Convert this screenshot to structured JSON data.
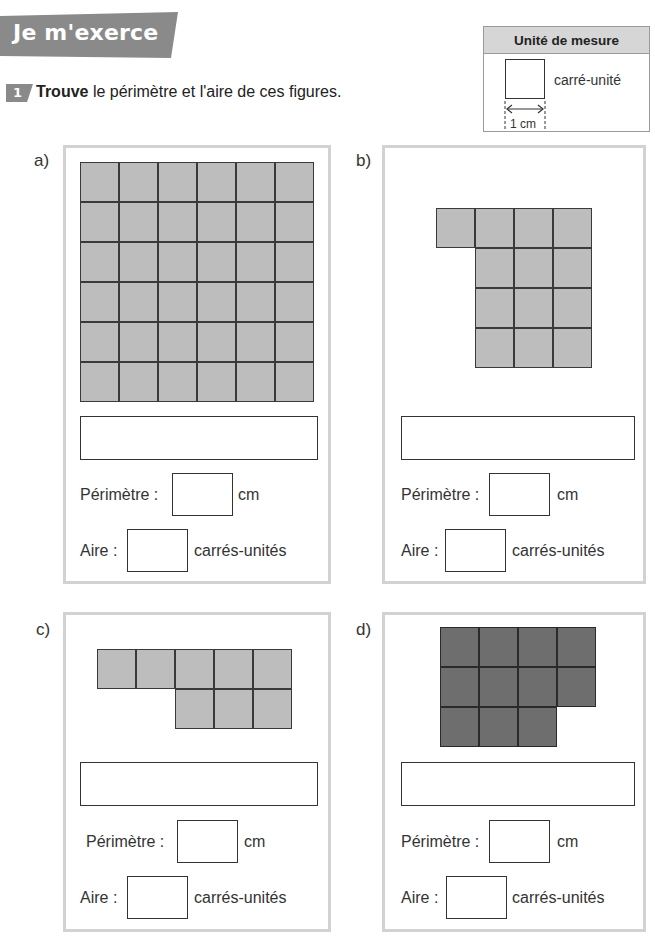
{
  "header": {
    "banner_title": "Je m'exerce",
    "exercise_number": "1",
    "instruction_bold": "Trouve",
    "instruction_rest": " le périmètre et l'aire de ces figures."
  },
  "unit_box": {
    "title": "Unité de mesure",
    "label": "carré-unité",
    "dimension": "1 cm"
  },
  "labels": {
    "perimeter": "Périmètre :",
    "perimeter_unit": "cm",
    "area": "Aire :",
    "area_unit": "carrés-unités"
  },
  "figures": [
    {
      "letter": "a)",
      "color": "#bdbdbd",
      "rows": [
        [
          0,
          1,
          2,
          3,
          4,
          5
        ],
        [
          0,
          1,
          2,
          3,
          4,
          5
        ],
        [
          0,
          1,
          2,
          3,
          4,
          5
        ],
        [
          0,
          1,
          2,
          3,
          4,
          5
        ],
        [
          0,
          1,
          2,
          3,
          4,
          5
        ],
        [
          0,
          1,
          2,
          3,
          4,
          5
        ]
      ],
      "cell_count": 36,
      "answer": "",
      "perimeter": "",
      "area": ""
    },
    {
      "letter": "b)",
      "color": "#bdbdbd",
      "rows": [
        [
          0,
          1,
          2,
          3
        ],
        [
          1,
          2,
          3
        ],
        [
          1,
          2,
          3
        ],
        [
          1,
          2,
          3
        ]
      ],
      "cell_count": 13,
      "answer": "",
      "perimeter": "",
      "area": ""
    },
    {
      "letter": "c)",
      "color": "#bdbdbd",
      "rows": [
        [
          0,
          1,
          2,
          3,
          4
        ],
        [
          2,
          3,
          4
        ]
      ],
      "cell_count": 8,
      "answer": "",
      "perimeter": "",
      "area": ""
    },
    {
      "letter": "d)",
      "color": "#6e6e6e",
      "rows": [
        [
          0,
          1,
          2,
          3
        ],
        [
          0,
          1,
          2,
          3
        ],
        [
          0,
          1,
          2
        ]
      ],
      "cell_count": 11,
      "answer": "",
      "perimeter": "",
      "area": ""
    }
  ]
}
